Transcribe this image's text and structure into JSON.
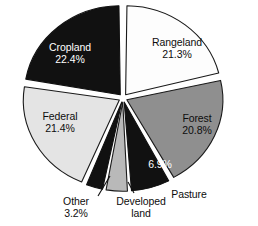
{
  "chart_data": {
    "type": "pie",
    "title": "",
    "subtitle": "",
    "xlabel": "",
    "ylabel": "",
    "legend_position": "none",
    "grid": false,
    "exploded": true,
    "start_angle_deg": 0,
    "direction": "clockwise",
    "categories": [
      "Rangeland",
      "Forest",
      "Pasture",
      "Developed land",
      "Other",
      "Federal",
      "Cropland"
    ],
    "values": [
      21.3,
      20.8,
      6.9,
      4.0,
      3.2,
      21.4,
      22.4
    ],
    "slices": [
      {
        "label": "Rangeland",
        "value": 21.3,
        "value_text": "21.3%",
        "value_shown": true,
        "label_placement": "inside",
        "fill": "#fdfdfd",
        "stroke": "#1a1a1a",
        "text_color": "#0d0d0d"
      },
      {
        "label": "Forest",
        "value": 20.8,
        "value_text": "20.8%",
        "value_shown": true,
        "label_placement": "inside",
        "fill": "#8f8f8f",
        "stroke": "#1a1a1a",
        "text_color": "#0d0d0d"
      },
      {
        "label": "Pasture",
        "value": 6.9,
        "value_text": "6.9%",
        "value_shown": true,
        "label_placement": "value-inside-label-outside",
        "fill": "#111111",
        "stroke": "#111111",
        "text_color": "#ffffff"
      },
      {
        "label": "Developed land",
        "value": 4.0,
        "value_text": "",
        "value_shown": false,
        "label_placement": "outside",
        "fill": "#b9b9b9",
        "stroke": "#1a1a1a",
        "text_color": "#0d0d0d"
      },
      {
        "label": "Other",
        "value": 3.2,
        "value_text": "3.2%",
        "value_shown": true,
        "label_placement": "outside",
        "fill": "#111111",
        "stroke": "#111111",
        "text_color": "#0d0d0d"
      },
      {
        "label": "Federal",
        "value": 21.4,
        "value_text": "21.4%",
        "value_shown": true,
        "label_placement": "inside",
        "fill": "#e4e4e4",
        "stroke": "#1a1a1a",
        "text_color": "#0d0d0d"
      },
      {
        "label": "Cropland",
        "value": 22.4,
        "value_text": "22.4%",
        "value_shown": true,
        "label_placement": "inside",
        "fill": "#111111",
        "stroke": "#111111",
        "text_color": "#ffffff"
      }
    ]
  },
  "labels": {
    "cropland_name": "Cropland",
    "cropland_value": "22.4%",
    "rangeland_name": "Rangeland",
    "rangeland_value": "21.3%",
    "forest_name": "Forest",
    "forest_value": "20.8%",
    "federal_name": "Federal",
    "federal_value": "21.4%",
    "pasture_name": "Pasture",
    "pasture_value": "6.9%",
    "developed_line1": "Developed",
    "developed_line2": "land",
    "other_name": "Other",
    "other_value": "3.2%"
  },
  "colors": {
    "background": "#ffffff",
    "outline": "#1a1a1a",
    "black_slice": "#111111",
    "dark_gray_slice": "#8f8f8f",
    "mid_gray_slice": "#b9b9b9",
    "light_gray_slice": "#e4e4e4",
    "white_slice": "#fdfdfd",
    "text_dark": "#0d0d0d",
    "text_light": "#ffffff"
  }
}
